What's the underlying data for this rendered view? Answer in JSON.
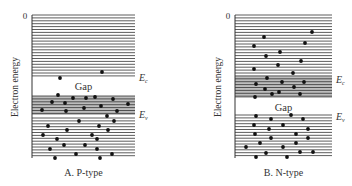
{
  "figure": {
    "panels": [
      {
        "id": "p-type",
        "caption": "A. P-type",
        "y_axis_label": "Electron energy",
        "zero_label": "0",
        "gap_label": "Gap",
        "ec_label": "E",
        "ec_sub": "c",
        "ev_label": "E",
        "ev_sub": "v",
        "box": {
          "x": 32,
          "y": 15,
          "w": 103,
          "h": 143
        },
        "upper_lines_from": 15,
        "upper_lines_to": 76,
        "gap": [
          76,
          96
        ],
        "shaded": [
          96,
          115
        ],
        "lower_lines_from": 118,
        "lower_lines_to": 158,
        "ec_y": 78,
        "ev_y": 115,
        "dots": [
          [
            60,
            78
          ],
          [
            102,
            72
          ],
          [
            58,
            95
          ],
          [
            52,
            102
          ],
          [
            73,
            98
          ],
          [
            86,
            98
          ],
          [
            95,
            97
          ],
          [
            113,
            99
          ],
          [
            65,
            103
          ],
          [
            101,
            106
          ],
          [
            84,
            108
          ],
          [
            128,
            104
          ],
          [
            42,
            110
          ],
          [
            66,
            111
          ],
          [
            117,
            111
          ],
          [
            107,
            116
          ],
          [
            79,
            121
          ],
          [
            114,
            121
          ],
          [
            48,
            126
          ],
          [
            99,
            126
          ],
          [
            67,
            130
          ],
          [
            108,
            130
          ],
          [
            43,
            135
          ],
          [
            92,
            135
          ],
          [
            57,
            139
          ],
          [
            97,
            139
          ],
          [
            64,
            145
          ],
          [
            85,
            145
          ],
          [
            50,
            149
          ],
          [
            97,
            149
          ],
          [
            76,
            154
          ],
          [
            112,
            154
          ],
          [
            55,
            158
          ],
          [
            100,
            158
          ]
        ]
      },
      {
        "id": "n-type",
        "caption": "B. N-type",
        "y_axis_label": "Electron energy",
        "zero_label": "0",
        "gap_label": "Gap",
        "ec_label": "E",
        "ec_sub": "c",
        "ev_label": "E",
        "ev_sub": "v",
        "box": {
          "x": 235,
          "y": 15,
          "w": 97,
          "h": 143
        },
        "upper_lines_from": 15,
        "upper_lines_to": 76,
        "shaded": [
          76,
          98
        ],
        "gap": [
          98,
          115
        ],
        "lower_lines_from": 115,
        "lower_lines_to": 158,
        "ec_y": 80,
        "ev_y": 117,
        "dots": [
          [
            312,
            32
          ],
          [
            264,
            37
          ],
          [
            305,
            43
          ],
          [
            254,
            46
          ],
          [
            280,
            52
          ],
          [
            266,
            56
          ],
          [
            301,
            61
          ],
          [
            278,
            65
          ],
          [
            254,
            69
          ],
          [
            293,
            73
          ],
          [
            267,
            78
          ],
          [
            282,
            82
          ],
          [
            304,
            82
          ],
          [
            256,
            84
          ],
          [
            294,
            87
          ],
          [
            265,
            89
          ],
          [
            279,
            92
          ],
          [
            272,
            94
          ],
          [
            300,
            94
          ],
          [
            255,
            97
          ],
          [
            256,
            116
          ],
          [
            291,
            115
          ],
          [
            271,
            119
          ],
          [
            303,
            119
          ],
          [
            254,
            125
          ],
          [
            283,
            125
          ],
          [
            269,
            129
          ],
          [
            308,
            129
          ],
          [
            255,
            134
          ],
          [
            296,
            134
          ],
          [
            271,
            138
          ],
          [
            308,
            138
          ],
          [
            260,
            143
          ],
          [
            296,
            143
          ],
          [
            246,
            147
          ],
          [
            283,
            147
          ],
          [
            266,
            153
          ],
          [
            300,
            152
          ],
          [
            313,
            152
          ],
          [
            256,
            157
          ],
          [
            287,
            157
          ]
        ]
      }
    ]
  }
}
